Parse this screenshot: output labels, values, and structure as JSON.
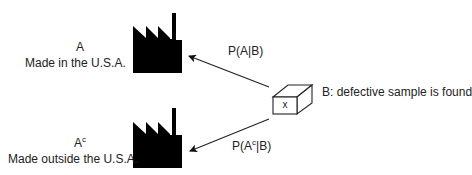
{
  "diagram": {
    "top": {
      "event": "A",
      "description": "Made in the U.S.A.",
      "arrow_label_prefix": "P(A",
      "arrow_label_suffix": "|B)"
    },
    "bottom": {
      "event_base": "A",
      "event_sup": "c",
      "description": "Made outside the U.S.A.",
      "arrow_label_prefix": "P(A",
      "arrow_label_sup": "c",
      "arrow_label_suffix": "|B)"
    },
    "sample": {
      "box_label": "x",
      "description": "B: defective sample is found"
    },
    "icons": [
      "factory-icon",
      "factory-icon",
      "box-icon",
      "arrow-icon",
      "arrow-icon"
    ],
    "colors": {
      "ink": "#000000",
      "text": "#222222"
    }
  }
}
